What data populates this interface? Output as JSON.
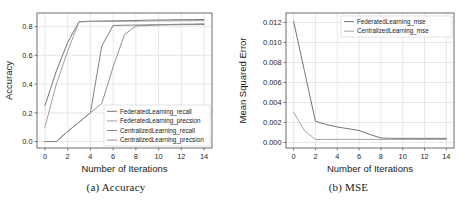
{
  "figure": {
    "subfigures": [
      {
        "caption": "(a) Accuracy",
        "id": "accuracy"
      },
      {
        "caption": "(b) MSE",
        "id": "mse"
      }
    ]
  },
  "chart_data": [
    {
      "type": "line",
      "id": "accuracy",
      "title": "",
      "subfigure_caption": "(a) Accuracy",
      "xlabel": "Number of Iterations",
      "ylabel": "Accuracy",
      "xlim": [
        -0.7,
        14.7
      ],
      "ylim": [
        -0.045,
        0.895
      ],
      "xticks": [
        0,
        2,
        4,
        6,
        8,
        10,
        12,
        14
      ],
      "xticklabels": [
        "0",
        "2",
        "4",
        "6",
        "8",
        "10",
        "12",
        "14"
      ],
      "yticks": [
        0.0,
        0.2,
        0.4,
        0.6,
        0.8
      ],
      "yticklabels": [
        "0.0",
        "0.2",
        "0.4",
        "0.6",
        "0.8"
      ],
      "grid": true,
      "legend_position": "lower right",
      "x": [
        0,
        1,
        2,
        3,
        4,
        5,
        6,
        7,
        8,
        9,
        10,
        11,
        12,
        13,
        14
      ],
      "series": [
        {
          "name": "FederatedLearning_recall",
          "color": "#6e6e6e",
          "values": [
            0.25,
            0.49,
            0.69,
            0.835,
            0.838,
            0.839,
            0.84,
            0.841,
            0.843,
            0.845,
            0.846,
            0.847,
            0.848,
            0.849,
            0.85
          ]
        },
        {
          "name": "FederatedLearning_precsion",
          "color": "#9a9a9a",
          "values": [
            0.1,
            0.4,
            0.63,
            0.833,
            0.835,
            0.836,
            0.837,
            0.838,
            0.838,
            0.839,
            0.84,
            0.84,
            0.841,
            0.841,
            0.842
          ]
        },
        {
          "name": "CentralizedLearning_recall",
          "color": "#7a7a7a",
          "values": [
            0.0,
            0.0,
            0.07,
            0.135,
            0.2,
            0.665,
            0.808,
            0.81,
            0.811,
            0.812,
            0.813,
            0.813,
            0.814,
            0.814,
            0.815
          ]
        },
        {
          "name": "CentralizedLearning_precsion",
          "color": "#8a8a8a",
          "values": [
            0.0,
            0.0,
            0.07,
            0.135,
            0.2,
            0.265,
            0.52,
            0.745,
            0.805,
            0.808,
            0.812,
            0.815,
            0.817,
            0.818,
            0.82
          ]
        }
      ]
    },
    {
      "type": "line",
      "id": "mse",
      "title": "",
      "subfigure_caption": "(b) MSE",
      "xlabel": "Number of Iterations",
      "ylabel": "Mean Squared Error",
      "xlim": [
        -0.7,
        14.7
      ],
      "ylim": [
        -0.00055,
        0.01295
      ],
      "xticks": [
        0,
        2,
        4,
        6,
        8,
        10,
        12,
        14
      ],
      "xticklabels": [
        "0",
        "2",
        "4",
        "6",
        "8",
        "10",
        "12",
        "14"
      ],
      "yticks": [
        0.0,
        0.002,
        0.004,
        0.006,
        0.008,
        0.01,
        0.012
      ],
      "yticklabels": [
        "0.000",
        "0.002",
        "0.004",
        "0.006",
        "0.008",
        "0.010",
        "0.012"
      ],
      "grid": true,
      "legend_position": "upper right",
      "x": [
        0,
        1,
        2,
        3,
        4,
        5,
        6,
        7,
        8,
        9,
        10,
        11,
        12,
        13,
        14
      ],
      "series": [
        {
          "name": "FederatedLearning_mse",
          "color": "#6e6e6e",
          "values": [
            0.0121,
            0.0071,
            0.00212,
            0.0018,
            0.00155,
            0.00138,
            0.0012,
            0.0008,
            0.00045,
            0.00042,
            0.00041,
            0.00041,
            0.00041,
            0.00041,
            0.00041
          ]
        },
        {
          "name": "CentralizedLearning_mse",
          "color": "#a0a0a0",
          "values": [
            0.003,
            0.00118,
            0.0003,
            0.00031,
            0.00031,
            0.00031,
            0.00031,
            0.00031,
            0.00031,
            0.00031,
            0.00031,
            0.00031,
            0.00031,
            0.00031,
            0.00031
          ]
        }
      ]
    }
  ]
}
